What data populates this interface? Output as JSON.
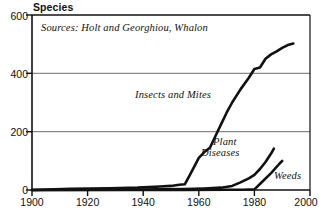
{
  "chart_data": {
    "type": "line",
    "title": "",
    "ylabel": "Species",
    "xlabel": "",
    "xlim": [
      1900,
      2000
    ],
    "ylim": [
      0,
      600
    ],
    "yticks": [
      0,
      200,
      400,
      600
    ],
    "xticks": [
      1900,
      1920,
      1940,
      1960,
      1980,
      2000
    ],
    "grid": "horizontal",
    "legend": "inline-annotations",
    "annotations": [
      {
        "name": "source-note",
        "text": "Sources: Holt and Georghiou, Whalon"
      },
      {
        "name": "series-label-insects",
        "text": "Insects and Mites"
      },
      {
        "name": "series-label-plant-diseases-line1",
        "text": "Plant"
      },
      {
        "name": "series-label-plant-diseases-line2",
        "text": "Diseases"
      },
      {
        "name": "series-label-weeds",
        "text": "Weeds"
      }
    ],
    "series": [
      {
        "name": "Insects and Mites",
        "color": "#111111",
        "x": [
          1900,
          1908,
          1914,
          1928,
          1938,
          1942,
          1946,
          1950,
          1953,
          1955,
          1957,
          1960,
          1962,
          1964,
          1966,
          1968,
          1970,
          1972,
          1975,
          1978,
          1980,
          1982,
          1984,
          1986,
          1988,
          1990,
          1992,
          1994
        ],
        "y": [
          0,
          2,
          4,
          6,
          8,
          10,
          12,
          14,
          18,
          20,
          55,
          110,
          130,
          145,
          185,
          225,
          265,
          300,
          345,
          385,
          415,
          420,
          450,
          465,
          475,
          487,
          497,
          502
        ]
      },
      {
        "name": "Plant Diseases",
        "color": "#111111",
        "x": [
          1900,
          1935,
          1945,
          1955,
          1962,
          1968,
          1972,
          1975,
          1978,
          1980,
          1982,
          1984,
          1986,
          1987
        ],
        "y": [
          0,
          1,
          2,
          3,
          5,
          8,
          14,
          26,
          40,
          52,
          72,
          96,
          125,
          142
        ]
      },
      {
        "name": "Weeds",
        "color": "#111111",
        "x": [
          1900,
          1955,
          1970,
          1976,
          1980,
          1983,
          1986,
          1989,
          1990
        ],
        "y": [
          0,
          0,
          1,
          1,
          2,
          30,
          58,
          90,
          100
        ]
      }
    ]
  },
  "axes": {
    "ylabel": "Species",
    "ytick_labels": [
      "600",
      "400",
      "200",
      "0"
    ],
    "xtick_labels": [
      "1900",
      "1920",
      "1940",
      "1960",
      "1980",
      "2000"
    ]
  },
  "notes": {
    "source": "Sources: Holt and Georghiou, Whalon"
  },
  "labels": {
    "insects": "Insects and Mites",
    "plant_diseases_line1": "Plant",
    "plant_diseases_line2": "Diseases",
    "weeds": "Weeds"
  },
  "colors": {
    "line": "#111111",
    "axis": "#111111",
    "grid": "#6b6b6b",
    "background": "#ffffff"
  }
}
